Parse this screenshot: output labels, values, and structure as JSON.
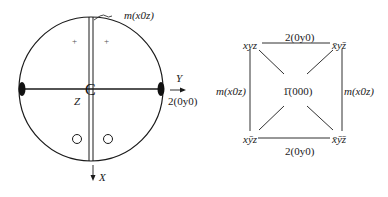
{
  "stereogram": {
    "mirror_label": "m(x0z)",
    "axis_y_label": "Y",
    "axis_y_operation": "2(0y0)",
    "axis_x_label": "X",
    "axis_z_label": "Z",
    "plus_markers": [
      "+",
      "+"
    ],
    "circle_markers": [
      "o",
      "o"
    ]
  },
  "group_table": {
    "corners": {
      "top_left": "xyz",
      "top_right": "x̄yz̄",
      "bottom_left": "xȳz",
      "bottom_right": "x̄ȳz̄"
    },
    "center": "1̄(000)",
    "top_edge": "2(0y0)",
    "bottom_edge": "2(0y0)",
    "left_edge": "m(x0z)",
    "right_edge": "m(x0z)"
  },
  "colors": {
    "ink": "#1a1a1a",
    "background": "#ffffff"
  }
}
